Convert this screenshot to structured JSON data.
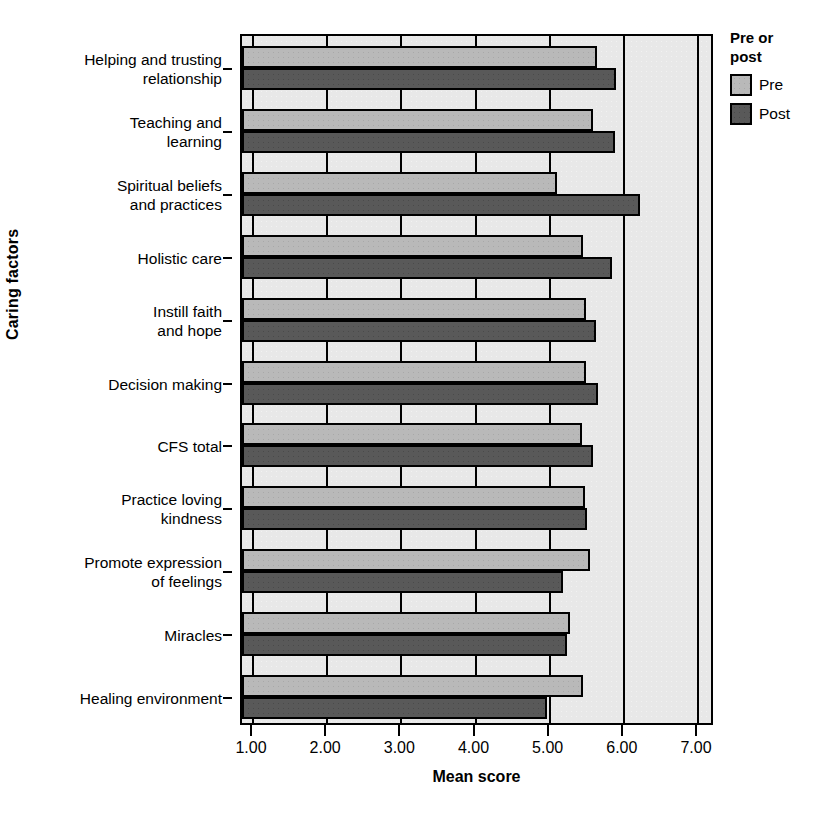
{
  "chart_data": {
    "type": "bar",
    "orientation": "horizontal",
    "title": "",
    "xlabel": "Mean score",
    "ylabel": "Caring factors",
    "xlim": [
      1.0,
      7.0
    ],
    "xticks": [
      "1.00",
      "2.00",
      "3.00",
      "4.00",
      "5.00",
      "6.00",
      "7.00"
    ],
    "xtick_values": [
      1.0,
      2.0,
      3.0,
      4.0,
      5.0,
      6.0,
      7.0
    ],
    "grid": "vertical",
    "legend": {
      "title": "Pre or\npost",
      "position": "right",
      "entries": [
        {
          "name": "Pre",
          "color": "#b9b9b9"
        },
        {
          "name": "Post",
          "color": "#595959"
        }
      ]
    },
    "categories": [
      "Helping and trusting\nrelationship",
      "Teaching and\nlearning",
      "Spiritual beliefs\nand practices",
      "Holistic care",
      "Instill faith\nand hope",
      "Decision making",
      "CFS total",
      "Practice loving\nkindness",
      "Promote expression\nof feelings",
      "Miracles",
      "Healing environment"
    ],
    "series": [
      {
        "name": "Pre",
        "color": "#b9b9b9",
        "values": [
          5.64,
          5.58,
          5.1,
          5.45,
          5.49,
          5.49,
          5.43,
          5.48,
          5.54,
          5.28,
          5.45
        ]
      },
      {
        "name": "Post",
        "color": "#595959",
        "values": [
          5.89,
          5.88,
          6.22,
          5.84,
          5.62,
          5.65,
          5.59,
          5.51,
          5.18,
          5.23,
          4.96
        ]
      }
    ]
  }
}
